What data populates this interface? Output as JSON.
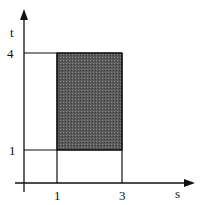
{
  "diagram": {
    "axes": {
      "x_label": "s",
      "y_label": "t"
    },
    "x_ticks": [
      "1",
      "3"
    ],
    "y_ticks": [
      "4",
      "1"
    ],
    "region": {
      "s_range": [
        1,
        3
      ],
      "t_range": [
        1,
        4
      ],
      "fill": "#555555"
    },
    "colors": {
      "line": "#111111",
      "background": "#ffffff"
    }
  }
}
